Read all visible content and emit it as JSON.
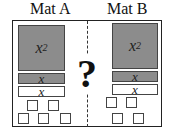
{
  "mats": [
    {
      "label": "Mat A",
      "x_squared_tile": {
        "base": "x",
        "exponent": "2",
        "color": "#8c8c8c"
      },
      "x_tiles": [
        {
          "label": "x",
          "fill": "gray"
        },
        {
          "label": "x",
          "fill": "white"
        }
      ],
      "unit_tiles": {
        "count": 5,
        "rows": [
          2,
          3
        ]
      }
    },
    {
      "label": "Mat B",
      "x_squared_tile": {
        "base": "x",
        "exponent": "2",
        "color": "#8c8c8c"
      },
      "x_tiles": [
        {
          "label": "x",
          "fill": "gray"
        },
        {
          "label": "x",
          "fill": "white"
        }
      ],
      "unit_tiles": {
        "count": 4,
        "rows": [
          2,
          2
        ]
      }
    }
  ],
  "comparison_symbol": "?"
}
